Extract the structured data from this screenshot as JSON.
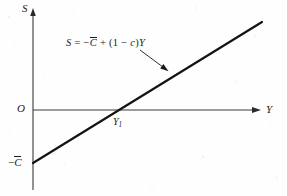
{
  "figure": {
    "type": "line-graph",
    "background_color": "#fefefe",
    "ink_color": "#1a1a1a",
    "axes": {
      "y_axis": {
        "label": "S",
        "origin_label": "O",
        "x_px": 33,
        "top_px": 10,
        "bottom_px": 190,
        "arrow": "up"
      },
      "x_axis": {
        "label": "Y",
        "y_px": 110,
        "left_px": 33,
        "right_px": 258,
        "arrow": "right"
      }
    },
    "labels": {
      "s_axis": "S",
      "y_axis": "Y",
      "origin": "O",
      "y_intercept_axis": "Y",
      "y_intercept_subscript": "1",
      "vertical_intercept_sign": "−",
      "vertical_intercept_symbol": "C"
    },
    "equation": {
      "lhs": "S",
      "equals": "=",
      "term_sign": "−",
      "term_symbol": "C",
      "plus": "+",
      "open_paren": "(",
      "one": "1",
      "minus": "−",
      "mpc": "c",
      "close_paren": ")",
      "income": "Y",
      "full_text": "S = −C̄ + (1 − c)Y"
    },
    "saving_line": {
      "start_px": {
        "x": 33,
        "y": 163
      },
      "end_px": {
        "x": 262,
        "y": 22
      },
      "x_intercept_px": 121,
      "stroke_width": 2.2,
      "color": "#141414"
    },
    "leader_arrow": {
      "from_px": {
        "x": 140,
        "y": 50
      },
      "to_px": {
        "x": 167,
        "y": 70
      },
      "color": "#1a1a1a"
    }
  }
}
